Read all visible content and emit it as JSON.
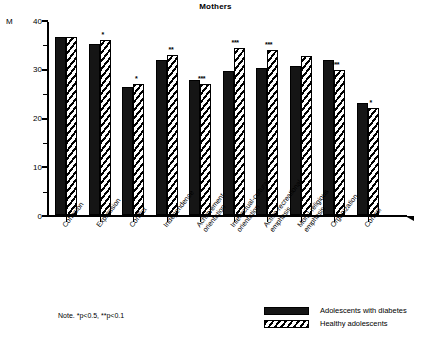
{
  "chart_data": {
    "type": "bar",
    "title": "Mothers",
    "xlabel": "",
    "ylabel": "M",
    "ylim": [
      0,
      40
    ],
    "yticks": [
      0,
      10,
      20,
      30,
      40
    ],
    "ytick_labels": [
      "0",
      "10",
      "20",
      "30",
      "40"
    ],
    "minor_ticks": [
      5,
      15,
      25,
      35
    ],
    "grid": false,
    "legend_position": "bottom-right",
    "categories": [
      "Cohesion",
      "Expression",
      "Conflict",
      "Independence",
      "Achievement-\norientation",
      "Intellectual-cultural\norientation",
      "Active-recreational\nemphasis",
      "Moral-religious\nemphasis",
      "Organization",
      "Control"
    ],
    "series": [
      {
        "name": "Adolescents with diabetes",
        "fill": "solid",
        "color": "#151515",
        "values": [
          36.6,
          35.1,
          26.2,
          31.8,
          27.7,
          29.5,
          30.2,
          30.6,
          31.8,
          23.0
        ]
      },
      {
        "name": "Healthy adolescents",
        "fill": "hatched",
        "color": "#000000",
        "values": [
          36.6,
          35.9,
          26.9,
          32.8,
          26.9,
          34.3,
          33.8,
          32.6,
          29.7,
          22.0
        ]
      }
    ],
    "significance_markers": [
      {
        "category": "Cohesion",
        "series": "Healthy adolescents",
        "marker": ""
      },
      {
        "category": "Expression",
        "series": "Healthy adolescents",
        "marker": "*"
      },
      {
        "category": "Conflict",
        "series": "Healthy adolescents",
        "marker": "*"
      },
      {
        "category": "Independence",
        "series": "Healthy adolescents",
        "marker": "**"
      },
      {
        "category": "Achievement-orientation",
        "series": "Healthy adolescents",
        "marker": "***"
      },
      {
        "category": "Intellectual-cultural orientation",
        "series": "Healthy adolescents",
        "marker": "***"
      },
      {
        "category": "Active-recreational emphasis",
        "series": "Healthy adolescents",
        "marker": "***"
      },
      {
        "category": "Moral-religious emphasis",
        "series": "Healthy adolescents",
        "marker": ""
      },
      {
        "category": "Organization",
        "series": "Healthy adolescents",
        "marker": "***"
      },
      {
        "category": "Control",
        "series": "Healthy adolescents",
        "marker": "*"
      }
    ],
    "note": "Note. *p<0.5, **p<0.1"
  },
  "axis": {
    "y_label": "M",
    "tick_40": "40",
    "tick_30": "30",
    "tick_20": "20",
    "tick_10": "10",
    "tick_0": "0"
  },
  "legend": {
    "items": [
      {
        "label": "Adolescents with diabetes"
      },
      {
        "label": "Healthy adolescents"
      }
    ]
  }
}
